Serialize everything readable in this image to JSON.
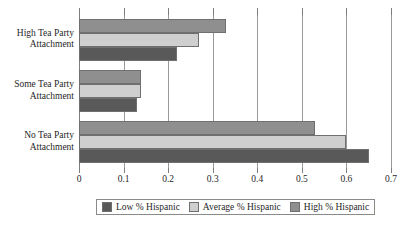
{
  "chart_data": {
    "type": "bar",
    "orientation": "horizontal",
    "title": "",
    "xlabel": "",
    "ylabel": "",
    "categories": [
      "High Tea Party Attachment",
      "Some Tea Party Attachment",
      "No Tea Party Attachment"
    ],
    "category_lines": [
      [
        "High Tea Party",
        "Attachment"
      ],
      [
        "Some Tea Party",
        "Attachment"
      ],
      [
        "No Tea Party",
        "Attachment"
      ]
    ],
    "series": [
      {
        "name": "Low % Hispanic",
        "color": "#595959",
        "values": [
          0.22,
          0.13,
          0.65
        ]
      },
      {
        "name": "Average % Hispanic",
        "color": "#cfcfcf",
        "values": [
          0.27,
          0.14,
          0.6
        ]
      },
      {
        "name": "High % Hispanic",
        "color": "#8f8f8f",
        "values": [
          0.33,
          0.14,
          0.53
        ]
      }
    ],
    "bar_order_top_to_bottom": [
      "High % Hispanic",
      "Average % Hispanic",
      "Low % Hispanic"
    ],
    "xlim": [
      0,
      0.7
    ],
    "xticks": [
      0,
      0.1,
      0.2,
      0.3,
      0.4,
      0.5,
      0.6,
      0.7
    ],
    "xtick_labels": [
      "0",
      "0.1",
      "0.2",
      "0.3",
      "0.4",
      "0.5",
      "0.6",
      "0.7"
    ],
    "grid": "vertical",
    "legend_position": "bottom"
  },
  "legend": {
    "items": [
      {
        "label": "Low % Hispanic",
        "color": "#595959"
      },
      {
        "label": "Average % Hispanic",
        "color": "#cfcfcf"
      },
      {
        "label": "High % Hispanic",
        "color": "#8f8f8f"
      }
    ]
  }
}
